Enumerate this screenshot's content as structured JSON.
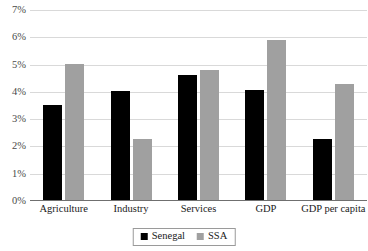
{
  "chart_data": {
    "type": "bar",
    "title": "",
    "subtitle": "",
    "xlabel": "",
    "ylabel": "",
    "categories": [
      "Agriculture",
      "Industry",
      "Services",
      "GDP",
      "GDP per capita"
    ],
    "series": [
      {
        "name": "Senegal",
        "color": "#000000",
        "values": [
          3.5,
          4.0,
          4.6,
          4.05,
          2.25
        ]
      },
      {
        "name": "SSA",
        "color": "#a0a0a0",
        "values": [
          5.0,
          2.25,
          4.75,
          5.85,
          4.25
        ]
      }
    ],
    "ylim": [
      0,
      7
    ],
    "ytick_values": [
      0,
      1,
      2,
      3,
      4,
      5,
      6,
      7
    ],
    "ytick_labels": [
      "0%",
      "1%",
      "2%",
      "3%",
      "4%",
      "5%",
      "6%",
      "7%"
    ],
    "grid": true,
    "grid_axis": "y",
    "legend_position": "bottom",
    "annotations": []
  },
  "axis": {
    "y_ticks": [
      {
        "label": "7%",
        "value": 7
      },
      {
        "label": "6%",
        "value": 6
      },
      {
        "label": "5%",
        "value": 5
      },
      {
        "label": "4%",
        "value": 4
      },
      {
        "label": "3%",
        "value": 3
      },
      {
        "label": "2%",
        "value": 2
      },
      {
        "label": "1%",
        "value": 1
      },
      {
        "label": "0%",
        "value": 0
      }
    ]
  },
  "legend": {
    "entries": [
      {
        "label": "Senegal",
        "color": "#000000"
      },
      {
        "label": "SSA",
        "color": "#a0a0a0"
      }
    ]
  }
}
